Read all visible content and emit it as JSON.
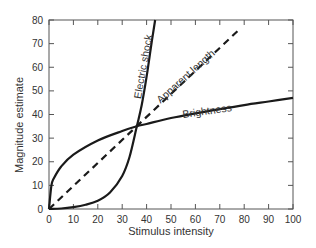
{
  "chart_data": {
    "type": "line",
    "title": "",
    "xlabel": "Stimulus intensity",
    "ylabel": "Magnitude estimate",
    "xlim": [
      0,
      100
    ],
    "ylim": [
      0,
      80
    ],
    "xticks": [
      0,
      10,
      20,
      30,
      40,
      50,
      60,
      70,
      80,
      90,
      100
    ],
    "yticks": [
      0,
      10,
      20,
      30,
      40,
      50,
      60,
      70,
      80
    ],
    "grid": false,
    "legend": "none (inline curve labels)",
    "series": [
      {
        "name": "Electric shock",
        "style": "solid",
        "x": [
          0,
          5,
          10,
          15,
          20,
          25,
          30,
          33,
          36,
          38,
          40,
          42,
          43.5
        ],
        "y": [
          0,
          0.2,
          0.8,
          1.8,
          3.5,
          7,
          14,
          22,
          35,
          44,
          56,
          70,
          80
        ]
      },
      {
        "name": "Apparent length",
        "style": "dashed",
        "x": [
          0,
          10,
          20,
          30,
          36,
          40,
          50,
          60,
          70,
          78
        ],
        "y": [
          0,
          10,
          20,
          30,
          35,
          39,
          49,
          59,
          68,
          76
        ]
      },
      {
        "name": "Brightness",
        "style": "solid",
        "x": [
          0,
          1,
          2,
          5,
          10,
          20,
          30,
          36,
          40,
          50,
          60,
          70,
          80,
          90,
          100
        ],
        "y": [
          0,
          10,
          13,
          18,
          23,
          29,
          33,
          35,
          36,
          38.5,
          40.5,
          42.3,
          44,
          45.5,
          47
        ]
      }
    ],
    "annotations": [
      {
        "text": "Electric shock",
        "x": 40,
        "y": 60,
        "rotation": -80
      },
      {
        "text": "Apparent length",
        "x": 57,
        "y": 55,
        "rotation": -42
      },
      {
        "text": "Brightness",
        "x": 65,
        "y": 40,
        "rotation": -8
      }
    ]
  }
}
